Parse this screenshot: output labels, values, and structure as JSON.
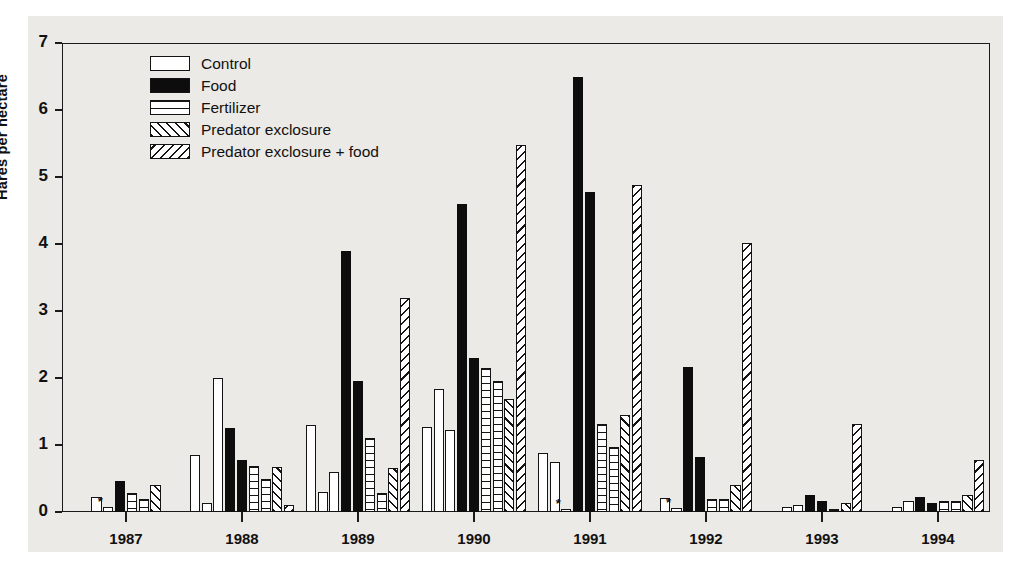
{
  "chart_data": {
    "type": "bar",
    "title": "",
    "xlabel": "",
    "ylabel": "Hares per hectare",
    "ylim": [
      0,
      7
    ],
    "yticks": [
      0,
      1,
      2,
      3,
      4,
      5,
      6,
      7
    ],
    "ytick_labels": [
      "0",
      "1",
      "2",
      "3",
      "4",
      "5",
      "6",
      "7"
    ],
    "grid": false,
    "legend_position": "upper-left-inside",
    "categories": [
      "1987",
      "1988",
      "1989",
      "1990",
      "1991",
      "1992",
      "1993",
      "1994"
    ],
    "legend": [
      {
        "label": "Control",
        "pattern": "white-open"
      },
      {
        "label": "Food",
        "pattern": "solid-black"
      },
      {
        "label": "Fertilizer",
        "pattern": "horizontal-lines"
      },
      {
        "label": "Predator exclosure",
        "pattern": "forward-diagonal-hatch"
      },
      {
        "label": "Predator exclosure + food",
        "pattern": "backward-diagonal-hatch"
      }
    ],
    "annotations": [
      {
        "symbol": "*",
        "year": "1987",
        "note": "asterisk above near-zero bar"
      },
      {
        "symbol": "*",
        "year": "1991",
        "note": "asterisk above near-zero bar"
      },
      {
        "symbol": "*",
        "year": "1992",
        "note": "asterisk above near-zero bar"
      }
    ],
    "groups": [
      {
        "year": "1987",
        "bars": [
          {
            "series": "Control",
            "pattern": "white-open",
            "value": 0.22
          },
          {
            "series": "Control",
            "pattern": "white-open",
            "value": 0.08,
            "star": true
          },
          {
            "series": "Food",
            "pattern": "solid-black",
            "value": 0.47
          },
          {
            "series": "Fertilizer",
            "pattern": "horizontal-lines",
            "value": 0.28
          },
          {
            "series": "Fertilizer",
            "pattern": "horizontal-lines",
            "value": 0.2
          },
          {
            "series": "Predator exclosure",
            "pattern": "forward-diagonal-hatch",
            "value": 0.4
          }
        ]
      },
      {
        "year": "1988",
        "bars": [
          {
            "series": "Control",
            "pattern": "white-open",
            "value": 0.85
          },
          {
            "series": "Control",
            "pattern": "white-open",
            "value": 0.13
          },
          {
            "series": "Control",
            "pattern": "white-open",
            "value": 2.0
          },
          {
            "series": "Food",
            "pattern": "solid-black",
            "value": 1.26
          },
          {
            "series": "Food",
            "pattern": "solid-black",
            "value": 0.78
          },
          {
            "series": "Fertilizer",
            "pattern": "horizontal-lines",
            "value": 0.68
          },
          {
            "series": "Fertilizer",
            "pattern": "horizontal-lines",
            "value": 0.5
          },
          {
            "series": "Predator exclosure",
            "pattern": "forward-diagonal-hatch",
            "value": 0.67
          },
          {
            "series": "Predator exclosure + food",
            "pattern": "backward-diagonal-hatch",
            "value": 0.1
          }
        ]
      },
      {
        "year": "1989",
        "bars": [
          {
            "series": "Control",
            "pattern": "white-open",
            "value": 1.3
          },
          {
            "series": "Control",
            "pattern": "white-open",
            "value": 0.3
          },
          {
            "series": "Control",
            "pattern": "white-open",
            "value": 0.6
          },
          {
            "series": "Food",
            "pattern": "solid-black",
            "value": 3.9
          },
          {
            "series": "Food",
            "pattern": "solid-black",
            "value": 1.95
          },
          {
            "series": "Fertilizer",
            "pattern": "horizontal-lines",
            "value": 1.1
          },
          {
            "series": "Fertilizer",
            "pattern": "horizontal-lines",
            "value": 0.28
          },
          {
            "series": "Predator exclosure",
            "pattern": "forward-diagonal-hatch",
            "value": 0.65
          },
          {
            "series": "Predator exclosure + food",
            "pattern": "backward-diagonal-hatch",
            "value": 3.2
          }
        ]
      },
      {
        "year": "1990",
        "bars": [
          {
            "series": "Control",
            "pattern": "white-open",
            "value": 1.27
          },
          {
            "series": "Control",
            "pattern": "white-open",
            "value": 1.83
          },
          {
            "series": "Control",
            "pattern": "white-open",
            "value": 1.22
          },
          {
            "series": "Food",
            "pattern": "solid-black",
            "value": 4.6
          },
          {
            "series": "Food",
            "pattern": "solid-black",
            "value": 2.3
          },
          {
            "series": "Fertilizer",
            "pattern": "horizontal-lines",
            "value": 2.15
          },
          {
            "series": "Fertilizer",
            "pattern": "horizontal-lines",
            "value": 1.95
          },
          {
            "series": "Predator exclosure",
            "pattern": "forward-diagonal-hatch",
            "value": 1.68
          },
          {
            "series": "Predator exclosure + food",
            "pattern": "backward-diagonal-hatch",
            "value": 5.48
          }
        ]
      },
      {
        "year": "1991",
        "bars": [
          {
            "series": "Control",
            "pattern": "white-open",
            "value": 0.88
          },
          {
            "series": "Control",
            "pattern": "white-open",
            "value": 0.75
          },
          {
            "series": "Control",
            "pattern": "white-open",
            "value": 0.05,
            "star": true
          },
          {
            "series": "Food",
            "pattern": "solid-black",
            "value": 6.5
          },
          {
            "series": "Food",
            "pattern": "solid-black",
            "value": 4.78
          },
          {
            "series": "Fertilizer",
            "pattern": "horizontal-lines",
            "value": 1.32
          },
          {
            "series": "Fertilizer",
            "pattern": "horizontal-lines",
            "value": 0.97
          },
          {
            "series": "Predator exclosure",
            "pattern": "forward-diagonal-hatch",
            "value": 1.45
          },
          {
            "series": "Predator exclosure + food",
            "pattern": "backward-diagonal-hatch",
            "value": 4.88
          }
        ]
      },
      {
        "year": "1992",
        "bars": [
          {
            "series": "Control",
            "pattern": "white-open",
            "value": 0.21
          },
          {
            "series": "Control",
            "pattern": "white-open",
            "value": 0.06,
            "star": true
          },
          {
            "series": "Food",
            "pattern": "solid-black",
            "value": 2.17
          },
          {
            "series": "Food",
            "pattern": "solid-black",
            "value": 0.82
          },
          {
            "series": "Fertilizer",
            "pattern": "horizontal-lines",
            "value": 0.19
          },
          {
            "series": "Fertilizer",
            "pattern": "horizontal-lines",
            "value": 0.19
          },
          {
            "series": "Predator exclosure",
            "pattern": "forward-diagonal-hatch",
            "value": 0.4
          },
          {
            "series": "Predator exclosure + food",
            "pattern": "backward-diagonal-hatch",
            "value": 4.02
          }
        ]
      },
      {
        "year": "1993",
        "bars": [
          {
            "series": "Control",
            "pattern": "white-open",
            "value": 0.08
          },
          {
            "series": "Control",
            "pattern": "white-open",
            "value": 0.1
          },
          {
            "series": "Food",
            "pattern": "solid-black",
            "value": 0.25
          },
          {
            "series": "Food",
            "pattern": "solid-black",
            "value": 0.17
          },
          {
            "series": "Fertilizer",
            "pattern": "horizontal-lines",
            "value": 0.04
          },
          {
            "series": "Predator exclosure",
            "pattern": "forward-diagonal-hatch",
            "value": 0.14
          },
          {
            "series": "Predator exclosure + food",
            "pattern": "backward-diagonal-hatch",
            "value": 1.32
          }
        ]
      },
      {
        "year": "1994",
        "bars": [
          {
            "series": "Control",
            "pattern": "white-open",
            "value": 0.07
          },
          {
            "series": "Control",
            "pattern": "white-open",
            "value": 0.16
          },
          {
            "series": "Food",
            "pattern": "solid-black",
            "value": 0.22
          },
          {
            "series": "Food",
            "pattern": "solid-black",
            "value": 0.13
          },
          {
            "series": "Fertilizer",
            "pattern": "horizontal-lines",
            "value": 0.17
          },
          {
            "series": "Fertilizer",
            "pattern": "horizontal-lines",
            "value": 0.17
          },
          {
            "series": "Predator exclosure",
            "pattern": "forward-diagonal-hatch",
            "value": 0.26
          },
          {
            "series": "Predator exclosure + food",
            "pattern": "backward-diagonal-hatch",
            "value": 0.78
          }
        ]
      }
    ]
  },
  "colors": {
    "ink": "#141414",
    "paper": "#eceae6",
    "fill_white": "#ffffff",
    "fill_black": "#0d0d0d"
  },
  "star_symbol": "*"
}
